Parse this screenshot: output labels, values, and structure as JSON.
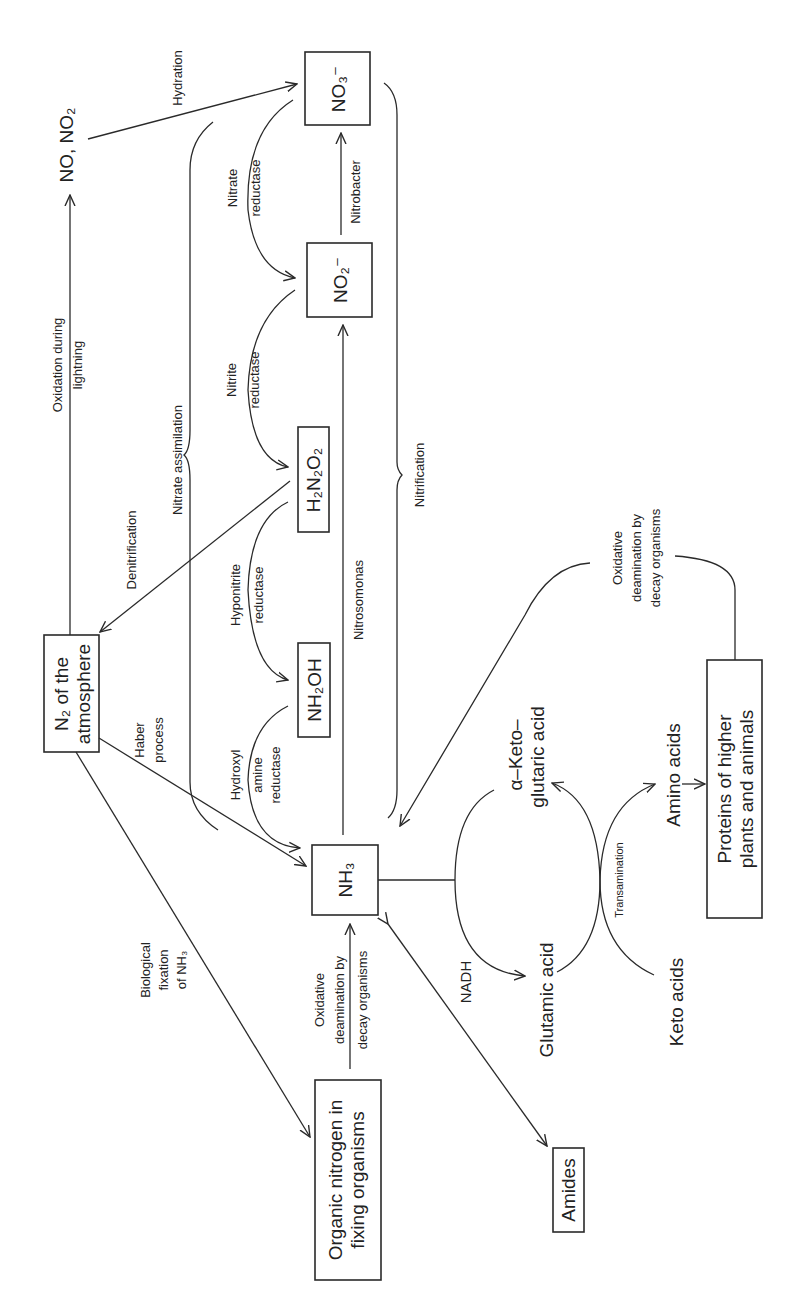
{
  "figure": {
    "orientation": "rotated 90 degrees counter-clockwise"
  },
  "nodes": {
    "no3": "NO₃⁻",
    "no2": "NO₂⁻",
    "h2n2o2": "H₂N₂O₂",
    "nh2oh": "NH₂OH",
    "nh3": "NH₃",
    "n2_line1": "N₂ of the",
    "n2_line2": "atmosphere",
    "no_no2": "NO, NO₂",
    "organic_line1": "Organic nitrogen in",
    "organic_line2": "fixing organisms",
    "amides": "Amides",
    "proteins_line1": "Proteins of higher",
    "proteins_line2": "plants and animals",
    "glutamic": "Glutamic acid",
    "aketo_line1": "α–Keto–",
    "aketo_line2": "glutaric acid",
    "keto_acids": "Keto acids",
    "amino_acids": "Amino acids"
  },
  "edges": {
    "hydration": "Hydration",
    "oxidation_line1": "Oxidation during",
    "oxidation_line2": "lightning",
    "nitrate_assimilation": "Nitrate assimilation",
    "nitrate_reductase_1": "Nitrate",
    "nitrate_reductase_2": "reductase",
    "nitrobacter": "Nitrobacter",
    "nitrite_reductase_1": "Nitrite",
    "nitrite_reductase_2": "reductase",
    "nitrification": "Nitrification",
    "denitrification": "Denitrification",
    "hyponitrite_1": "Hyponitrite",
    "hyponitrite_2": "reductase",
    "nitrosomonas": "Nitrosomonas",
    "haber_1": "Haber",
    "haber_2": "process",
    "hydroxyl_1": "Hydroxyl",
    "hydroxyl_2": "amine",
    "hydroxyl_3": "reductase",
    "biofix_1": "Biological",
    "biofix_2": "fixation",
    "biofix_3": "of NH₃",
    "oxdeam_low_1": "Oxidative",
    "oxdeam_low_2": "deamination by",
    "oxdeam_low_3": "decay organisms",
    "oxdeam_high_1": "Oxidative",
    "oxdeam_high_2": "deamination by",
    "oxdeam_high_3": "decay organisms",
    "nadh": "NADH",
    "transamination": "Transamination"
  }
}
